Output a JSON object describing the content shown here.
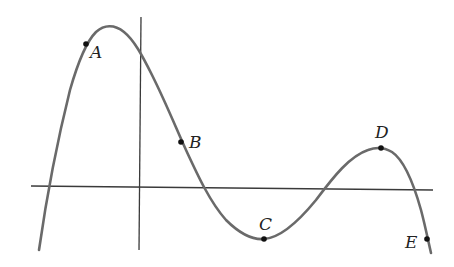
{
  "figure": {
    "type": "function-graph",
    "colors": {
      "curve": "#6a6a6a",
      "axes": "#3a3a3a",
      "points": "#111111",
      "labels": "#222222",
      "background": "#ffffff"
    }
  },
  "axes": {
    "x_axis": {
      "x1": 31,
      "y1": 186,
      "x2": 433,
      "y2": 190
    },
    "y_axis": {
      "x1": 141,
      "y1": 17,
      "x2": 139,
      "y2": 250
    }
  },
  "points": [
    {
      "name": "A",
      "label": "A",
      "x": 86,
      "y": 44,
      "label_x": 90,
      "label_y": 58,
      "feature": "on rising part, before local maximum"
    },
    {
      "name": "B",
      "label": "B",
      "x": 181,
      "y": 142,
      "label_x": 189,
      "label_y": 148,
      "feature": "on decreasing part, above x-axis"
    },
    {
      "name": "C",
      "label": "C",
      "x": 264,
      "y": 239,
      "label_x": 259,
      "label_y": 230,
      "feature": "local minimum"
    },
    {
      "name": "D",
      "label": "D",
      "x": 381,
      "y": 148,
      "label_x": 375,
      "label_y": 138,
      "feature": "local maximum"
    },
    {
      "name": "E",
      "label": "E",
      "x": 427,
      "y": 239,
      "label_x": 405,
      "label_y": 248,
      "feature": "on falling part, below x-axis"
    }
  ]
}
